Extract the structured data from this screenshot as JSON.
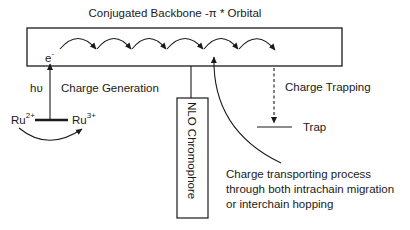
{
  "diagram": {
    "title": "Conjugated Backbone -π * Orbital",
    "backbone": {
      "electron_label": "e",
      "electron_charge": "-",
      "hop_count": 6
    },
    "excitation": {
      "photon_label": "hυ",
      "process_label": "Charge Generation",
      "donor_base": "Ru",
      "donor_charge": "2+",
      "acceptor_base": "Ru",
      "acceptor_charge": "3+"
    },
    "chromophore": {
      "label": "NLO Chromophore"
    },
    "trapping": {
      "process_label": "Charge Trapping",
      "trap_label": "Trap"
    },
    "transport_note": {
      "lines": [
        "Charge transporting process",
        "through both intrachain migration",
        "or interchain hopping"
      ]
    },
    "colors": {
      "ink": "#1a1a1a",
      "background": "#ffffff"
    }
  }
}
